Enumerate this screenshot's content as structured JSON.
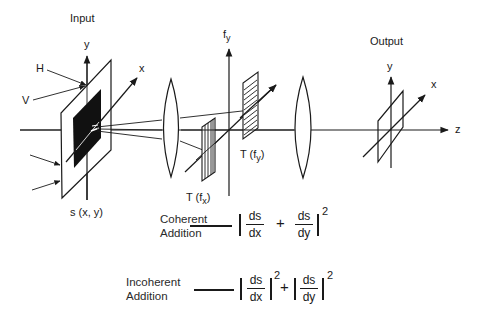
{
  "diagram": {
    "labels": {
      "input": "Input",
      "output": "Output",
      "input_y": "y",
      "input_x": "x",
      "h": "H",
      "v": "V",
      "input_function": "s (x, y)",
      "fy_axis": "f",
      "fy_axis_sub": "y",
      "t_fx": "T (f",
      "t_fx_sub": "x",
      "t_fy": "T (f",
      "t_fy_sub": "y",
      "close_paren": ")",
      "output_y": "y",
      "output_x": "x",
      "output_z": "z"
    },
    "equations": {
      "coherent": {
        "label_line1": "Coherent",
        "label_line2": "Addition",
        "num1": "ds",
        "den1": "dx",
        "plus": "+",
        "num2": "ds",
        "den2": "dy",
        "exponent": "2"
      },
      "incoherent": {
        "label_line1": "Incoherent",
        "label_line2": "Addition",
        "num1": "ds",
        "den1": "dx",
        "exp1": "2",
        "plus": "+",
        "num2": "ds",
        "den2": "dy",
        "exp2": "2"
      }
    },
    "colors": {
      "ink": "#1a1a1a",
      "background": "#ffffff"
    }
  }
}
